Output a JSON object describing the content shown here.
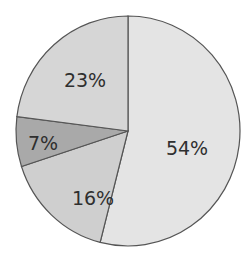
{
  "chart_data": {
    "type": "pie",
    "title": "",
    "categories": [
      "Slice A",
      "Slice B",
      "Slice C",
      "Slice D"
    ],
    "values": [
      54,
      16,
      7,
      23
    ],
    "labels": [
      "54%",
      "16%",
      "7%",
      "23%"
    ],
    "colors": [
      "#e4e4e4",
      "#cfcfcf",
      "#a9a9a9",
      "#d6d6d6"
    ],
    "start_angle_deg": 0,
    "direction": "clockwise from top"
  }
}
